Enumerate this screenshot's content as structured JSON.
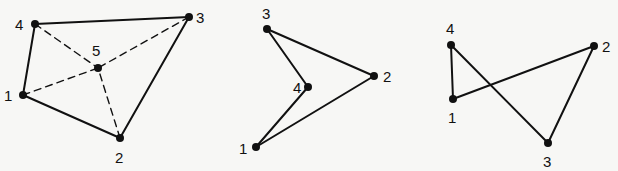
{
  "figures": [
    {
      "id": "quad-with-center",
      "nodes": [
        {
          "label": "1",
          "x": 23,
          "y": 95,
          "lx": 4,
          "ly": 101
        },
        {
          "label": "2",
          "x": 120,
          "y": 138,
          "lx": 115,
          "ly": 163
        },
        {
          "label": "3",
          "x": 189,
          "y": 17,
          "lx": 196,
          "ly": 23
        },
        {
          "label": "4",
          "x": 35,
          "y": 24,
          "lx": 15,
          "ly": 30
        },
        {
          "label": "5",
          "x": 98,
          "y": 68,
          "lx": 92,
          "ly": 56
        }
      ],
      "edges": [
        {
          "from": "1",
          "to": "2",
          "style": "solid"
        },
        {
          "from": "2",
          "to": "3",
          "style": "solid"
        },
        {
          "from": "3",
          "to": "4",
          "style": "solid"
        },
        {
          "from": "4",
          "to": "1",
          "style": "solid"
        },
        {
          "from": "1",
          "to": "5",
          "style": "dashed"
        },
        {
          "from": "2",
          "to": "5",
          "style": "dashed"
        },
        {
          "from": "3",
          "to": "5",
          "style": "dashed"
        },
        {
          "from": "4",
          "to": "5",
          "style": "dashed"
        }
      ]
    },
    {
      "id": "concave-quad",
      "nodes": [
        {
          "label": "1",
          "x": 256,
          "y": 147,
          "lx": 239,
          "ly": 154
        },
        {
          "label": "2",
          "x": 374,
          "y": 76,
          "lx": 383,
          "ly": 82
        },
        {
          "label": "3",
          "x": 267,
          "y": 29,
          "lx": 262,
          "ly": 19
        },
        {
          "label": "4",
          "x": 308,
          "y": 87,
          "lx": 293,
          "ly": 93
        }
      ],
      "edges": [
        {
          "from": "1",
          "to": "2",
          "style": "solid"
        },
        {
          "from": "2",
          "to": "3",
          "style": "solid"
        },
        {
          "from": "3",
          "to": "4",
          "style": "solid"
        },
        {
          "from": "4",
          "to": "1",
          "style": "solid"
        }
      ]
    },
    {
      "id": "self-intersecting-quad",
      "nodes": [
        {
          "label": "1",
          "x": 453,
          "y": 99,
          "lx": 448,
          "ly": 123
        },
        {
          "label": "2",
          "x": 594,
          "y": 46,
          "lx": 602,
          "ly": 52
        },
        {
          "label": "3",
          "x": 548,
          "y": 143,
          "lx": 543,
          "ly": 167
        },
        {
          "label": "4",
          "x": 451,
          "y": 45,
          "lx": 446,
          "ly": 34
        }
      ],
      "edges": [
        {
          "from": "1",
          "to": "2",
          "style": "solid"
        },
        {
          "from": "2",
          "to": "3",
          "style": "solid"
        },
        {
          "from": "3",
          "to": "4",
          "style": "solid"
        },
        {
          "from": "4",
          "to": "1",
          "style": "solid"
        }
      ]
    }
  ],
  "colors": {
    "ink": "#111111",
    "paper": "#f7f7f5"
  }
}
